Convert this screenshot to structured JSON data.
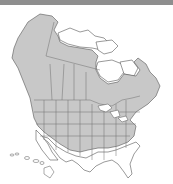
{
  "map": {
    "title": "",
    "region": "North America",
    "legend": [],
    "colors": {
      "topbar": "#8e8e8e",
      "range_fill": "#c8c8c8",
      "land_outside_range": "#ffffff",
      "borders": "#6e6e6e",
      "coast": "#555555",
      "water": "#ffffff"
    }
  }
}
